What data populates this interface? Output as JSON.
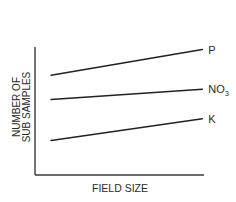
{
  "chart_data": {
    "type": "line",
    "title": "",
    "xlabel": "FIELD SIZE",
    "ylabel_lines": [
      "NUMBER OF",
      "SUB SAMPLES"
    ],
    "ylabel": "NUMBER OF SUB SAMPLES",
    "x_ticks": [],
    "y_ticks": [],
    "grid": false,
    "legend": "inline-right",
    "xlim": [
      0,
      100
    ],
    "ylim": [
      0,
      100
    ],
    "x": [
      9.5,
      99
    ],
    "series": [
      {
        "name": "P",
        "label_main": "P",
        "label_sub": "",
        "values": [
          78,
          98
        ]
      },
      {
        "name": "NO3",
        "label_main": "NO",
        "label_sub": "3",
        "values": [
          59,
          67
        ]
      },
      {
        "name": "K",
        "label_main": "K",
        "label_sub": "",
        "values": [
          27,
          44
        ]
      }
    ],
    "note": "Qualitative schematic; axes carry no numeric ticks, values are relative (0–100 normalized)."
  },
  "colors": {
    "line": "#222222",
    "axis": "#3a3a3a",
    "text": "#2a2a2a",
    "background": "#ffffff"
  }
}
